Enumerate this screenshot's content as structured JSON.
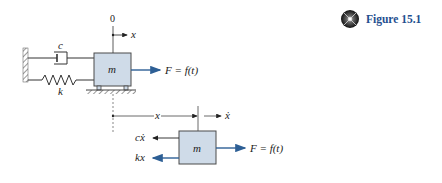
{
  "figure": {
    "title": "Figure 15.1",
    "icon": "animation-disc-icon",
    "accent_color": "#1f4f8f"
  },
  "colors": {
    "mass_fill": "#cfdbe8",
    "mass_stroke": "#4a4a4a",
    "force_arrow": "#2d5f95",
    "line": "#333333",
    "ground_hatch": "#555555"
  },
  "top_diagram": {
    "origin_label": "0",
    "axis_label": "x",
    "damper_label": "c",
    "spring_label": "k",
    "mass_label": "m",
    "force_label": "F = f(t)"
  },
  "free_body_diagram": {
    "displacement_label": "x",
    "velocity_label": "ẋ",
    "damping_force_label": "cẋ",
    "spring_force_label": "kx",
    "mass_label": "m",
    "force_label": "F = f(t)"
  }
}
